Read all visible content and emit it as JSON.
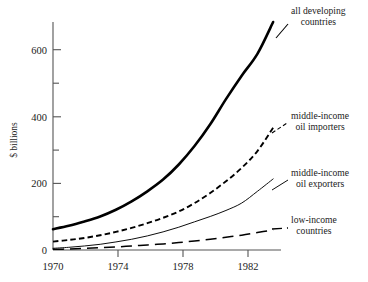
{
  "chart_data": {
    "type": "line",
    "title": "",
    "xlabel": "",
    "ylabel": "$ billions",
    "xlim": [
      1970,
      1984.5
    ],
    "ylim": [
      0,
      680
    ],
    "grid": false,
    "legend_position": "right-inline-labels",
    "x_ticks_major": [
      1970,
      1974,
      1978,
      1982
    ],
    "x_tick_labels": [
      "1970",
      "1974",
      "1978",
      "1982"
    ],
    "y_ticks_major": [
      0,
      200,
      400,
      600
    ],
    "y_tick_labels": [
      "0",
      "200",
      "400",
      "600"
    ],
    "y_ticks_minor": [
      100,
      300,
      500
    ],
    "x": [
      1970,
      1971,
      1972,
      1973,
      1974,
      1975,
      1976,
      1977,
      1978,
      1979,
      1980,
      1981,
      1982,
      1983,
      1984
    ],
    "series": [
      {
        "name": "all developing countries",
        "style": "thick-solid",
        "color": "#000000",
        "values": [
          62,
          72,
          85,
          100,
          120,
          145,
          175,
          210,
          255,
          310,
          375,
          450,
          520,
          585,
          680
        ]
      },
      {
        "name": "middle-income oil importers",
        "style": "short-dashed",
        "color": "#000000",
        "values": [
          25,
          30,
          36,
          44,
          54,
          66,
          80,
          96,
          115,
          140,
          170,
          205,
          245,
          295,
          365
        ]
      },
      {
        "name": "middle-income oil exporters",
        "style": "thin-solid",
        "color": "#000000",
        "values": [
          5,
          8,
          12,
          17,
          24,
          32,
          42,
          54,
          68,
          84,
          100,
          118,
          140,
          175,
          212
        ]
      },
      {
        "name": "low-income countries",
        "style": "long-dashed",
        "color": "#000000",
        "values": [
          2,
          3,
          5,
          7,
          9,
          12,
          15,
          18,
          22,
          27,
          32,
          38,
          44,
          52,
          60
        ]
      }
    ]
  },
  "axes": {
    "y_axis_title": "$ billions",
    "y_labels": [
      "600",
      "400",
      "200",
      "0"
    ],
    "x_labels": [
      "1970",
      "1974",
      "1978",
      "1982"
    ]
  },
  "annotations": {
    "all_developing": {
      "line1": "all developing",
      "line2": "countries"
    },
    "oil_importers": {
      "line1": "middle-income",
      "line2": "oil importers"
    },
    "oil_exporters": {
      "line1": "middle-income",
      "line2": "oil exporters"
    },
    "low_income": {
      "line1": "low-income",
      "line2": "countries"
    }
  }
}
